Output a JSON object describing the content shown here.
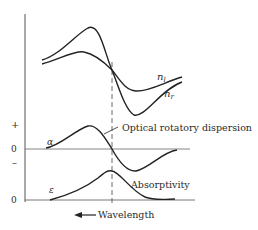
{
  "diagram": {
    "curves": {
      "n_left_label": "n",
      "n_left_sub": "l",
      "n_right_label": "n",
      "n_right_sub": "r",
      "ord_label": "Optical rotatory dispersion",
      "alpha_label": "α",
      "epsilon_label": "ε",
      "absorptivity_label": "Absorptivity"
    },
    "axis": {
      "plus": "+",
      "zero_upper": "0",
      "minus": "–",
      "zero_lower": "0"
    },
    "xaxis_label": "Wavelength",
    "arrow": "←"
  }
}
